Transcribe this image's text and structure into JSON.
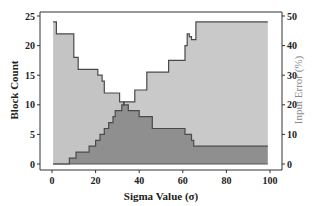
{
  "chart_data": {
    "type": "area",
    "title": "",
    "xlabel": "Sigma Value (σ)",
    "ylabel": "Block Count",
    "ylabel_right": "Input Error (%)",
    "xlim": [
      0,
      100
    ],
    "ylim": [
      0,
      25
    ],
    "ylim_right": [
      0,
      50
    ],
    "xticks": [
      0,
      20,
      40,
      60,
      80,
      100
    ],
    "yticks": [
      0,
      5,
      10,
      15,
      20,
      25
    ],
    "yticks_right": [
      0,
      10,
      20,
      30,
      40,
      50
    ],
    "grid": false,
    "legend": null,
    "series": [
      {
        "name": "Block Count",
        "axis": "left",
        "style": "step-area",
        "color": "#b5b5b5",
        "x": [
          0.5,
          2,
          8,
          10,
          12,
          19,
          21,
          23,
          24,
          28,
          31,
          33,
          35,
          40,
          44,
          46,
          61,
          64,
          65,
          99
        ],
        "values": [
          24,
          22,
          22,
          18,
          16,
          16,
          15,
          14,
          12,
          12,
          10.5,
          10,
          9,
          8,
          8,
          6,
          5,
          4,
          3,
          3
        ]
      },
      {
        "name": "Input Error",
        "axis": "right",
        "style": "step-area",
        "color": "#888888",
        "x": [
          0.5,
          7,
          8,
          11,
          17,
          20,
          22,
          24,
          26,
          28,
          29,
          32,
          33,
          38,
          43.5,
          53.5,
          61,
          62,
          63,
          64,
          66,
          99
        ],
        "values": [
          0,
          0,
          2,
          4,
          6,
          8,
          10,
          12,
          14,
          16,
          18,
          20,
          21,
          25,
          31,
          35,
          40,
          44,
          43,
          42,
          48,
          48
        ]
      }
    ]
  }
}
